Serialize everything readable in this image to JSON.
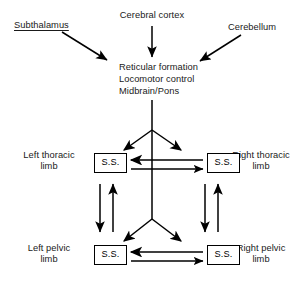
{
  "diagram": {
    "ink_color": "#000000",
    "background_color": "#ffffff",
    "inputs": {
      "subthalamus": "Subthalamus",
      "cerebral_cortex": "Cerebral cortex",
      "cerebellum": "Cerebellum"
    },
    "center_block": {
      "line1": "Reticular formation",
      "line2": "Locomotor control",
      "line3": "Midbrain/Pons"
    },
    "limbs": {
      "left_thoracic": "Left thoracic\nlimb",
      "right_thoracic": "Right thoracic\nlimb",
      "left_pelvic": "Left pelvic\nlimb",
      "right_pelvic": "Right pelvic\nlimb"
    },
    "segment_boxes": {
      "left_thoracic_ss": "S.S.",
      "right_thoracic_ss": "S.S.",
      "left_pelvic_ss": "S.S.",
      "right_pelvic_ss": "S.S."
    }
  }
}
